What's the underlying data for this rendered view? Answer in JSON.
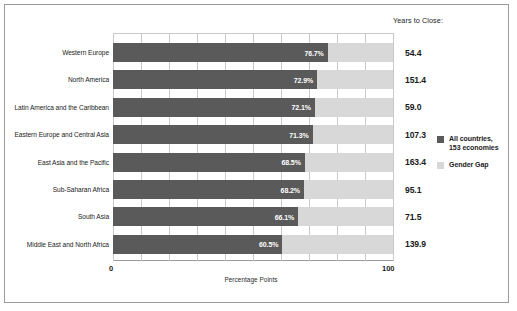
{
  "header": {
    "years_to_close_label": "Years to Close:"
  },
  "axis": {
    "tick_min": "0",
    "tick_max": "100",
    "title": "Percentage Points"
  },
  "legend": {
    "items": [
      {
        "label_line1": "All countries,",
        "label_line2": "153 economies",
        "color": "#5a5a5a",
        "swatch_name": "legend-swatch-all-countries"
      },
      {
        "label_line1": "Gender Gap",
        "label_line2": "",
        "color": "#d8d8d8",
        "swatch_name": "legend-swatch-gender-gap"
      }
    ]
  },
  "colors": {
    "bar_main": "#5a5a5a",
    "bar_gap": "#d8d8d8",
    "gridline": "#c9c9c9",
    "border": "#9a9a9a",
    "text": "#1b1b1b"
  },
  "chart_data": {
    "type": "bar",
    "orientation": "horizontal",
    "stacked": true,
    "title": "",
    "xlabel": "Percentage Points",
    "ylabel": "",
    "xlim": [
      0,
      100
    ],
    "xticks": [
      0,
      100
    ],
    "grid": true,
    "grid_interval": 10,
    "legend_position": "right",
    "categories": [
      "Western Europe",
      "North America",
      "Latin America and the Caribbean",
      "Eastern Europe and Central Asia",
      "East Asia and the Pacific",
      "Sub-Saharan Africa",
      "South Asia",
      "Middle East and North Africa"
    ],
    "series": [
      {
        "name": "All countries, 153 economies",
        "color": "#5a5a5a",
        "values": [
          76.7,
          72.9,
          72.1,
          71.3,
          68.5,
          68.2,
          66.1,
          60.5
        ],
        "labels": [
          "76.7%",
          "72.9%",
          "72.1%",
          "71.3%",
          "68.5%",
          "68.2%",
          "66.1%",
          "60.5%"
        ]
      },
      {
        "name": "Gender Gap",
        "color": "#d8d8d8",
        "values": [
          23.3,
          27.1,
          27.9,
          28.7,
          31.5,
          31.8,
          33.9,
          39.5
        ],
        "labels": [
          "",
          "",
          "",
          "",
          "",
          "",
          "",
          ""
        ]
      }
    ],
    "annotations": {
      "name": "Years to Close",
      "values": [
        54.4,
        151.4,
        59.0,
        107.3,
        163.4,
        95.1,
        71.5,
        139.9
      ],
      "labels": [
        "54.4",
        "151.4",
        "59.0",
        "107.3",
        "163.4",
        "95.1",
        "71.5",
        "139.9"
      ]
    }
  }
}
